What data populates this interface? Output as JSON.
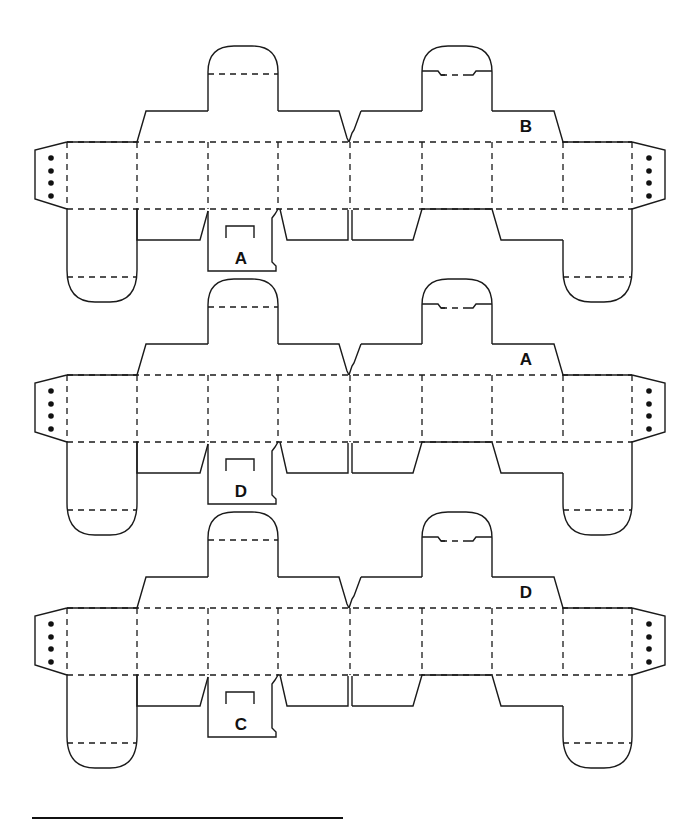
{
  "diagram": {
    "title": "",
    "colors": {
      "line": "#1a1a1a",
      "background": "#ffffff"
    },
    "nets": [
      {
        "index": 1,
        "bottom_tab_label": "A",
        "top_flap_label": "B",
        "offset_y": 0
      },
      {
        "index": 2,
        "bottom_tab_label": "D",
        "top_flap_label": "A",
        "offset_y": 233
      },
      {
        "index": 3,
        "bottom_tab_label": "C",
        "top_flap_label": "D",
        "offset_y": 466
      }
    ],
    "glue_tab_dots_per_side": 4,
    "footer_rule": {
      "x1": 32,
      "x2": 343,
      "y": 818
    }
  }
}
